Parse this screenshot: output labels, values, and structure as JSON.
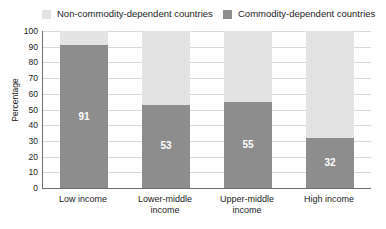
{
  "chart_data": {
    "type": "bar",
    "subtype": "stacked-100-percent",
    "title": "",
    "xlabel": "",
    "ylabel": "Percentage",
    "ylim": [
      0,
      100
    ],
    "yticks": [
      0,
      10,
      20,
      30,
      40,
      50,
      60,
      70,
      80,
      90,
      100
    ],
    "grid": true,
    "legend_position": "top",
    "categories": [
      "Low income",
      "Lower-middle income",
      "Upper-middle income",
      "High income"
    ],
    "series": [
      {
        "name": "Commodity-dependent countries",
        "color": "#8d8d8d",
        "values": [
          91,
          53,
          55,
          32
        ],
        "labels": [
          "91",
          "53",
          "55",
          "32"
        ]
      },
      {
        "name": "Non-commodity-dependent countries",
        "color": "#e3e3e3",
        "values": [
          9,
          47,
          45,
          68
        ],
        "labels": [
          "",
          "",
          "",
          ""
        ]
      }
    ]
  },
  "legend": {
    "entries": [
      {
        "label": "Non-commodity-dependent countries",
        "color": "#e3e3e3",
        "swatch": "light"
      },
      {
        "label": "Commodity-dependent countries",
        "color": "#8d8d8d",
        "swatch": "dark"
      }
    ]
  },
  "axes": {
    "y_title": "Percentage",
    "y_tick_labels": [
      "100",
      "90",
      "80",
      "70",
      "60",
      "50",
      "40",
      "30",
      "20",
      "10",
      "0"
    ],
    "x_tick_labels": [
      [
        "Low income"
      ],
      [
        "Lower-middle",
        "income"
      ],
      [
        "Upper-middle",
        "income"
      ],
      [
        "High income"
      ]
    ]
  },
  "colors": {
    "commodity_dependent": "#8d8d8d",
    "non_commodity_dependent": "#e3e3e3",
    "gridline": "#d8d8d8",
    "axis": "#6e6e6e",
    "text": "#1b1b1b",
    "background": "#ffffff"
  }
}
